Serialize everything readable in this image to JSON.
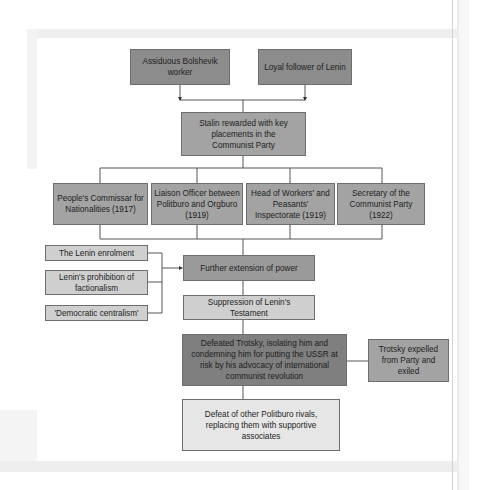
{
  "diagram": {
    "top_causes": [
      {
        "label": "Assiduous Bolshevik worker"
      },
      {
        "label": "Loyal follower of Lenin"
      }
    ],
    "reward": {
      "label": "Stalin rewarded with key placements in the Communist Party"
    },
    "positions": [
      {
        "label": "People's Commissar for Nationalities (1917)"
      },
      {
        "label": "Liaison Officer between Politburo and Orgburo (1919)"
      },
      {
        "label": "Head of Workers' and Peasants' Inspectorate (1919)"
      },
      {
        "label": "Secretary of the Communist Party (1922)"
      }
    ],
    "factors": [
      {
        "label": "The Lenin enrolment"
      },
      {
        "label": "Lenin's prohibition of factionalism"
      },
      {
        "label": "'Democratic centralism'"
      }
    ],
    "extension": {
      "label": "Further extension of power"
    },
    "suppression": {
      "label": "Suppression of Lenin's Testament"
    },
    "defeat_trotsky": {
      "label": "Defeated Trotsky, isolating him and condemning him for putting the USSR at risk by his advocacy of international communist revolution"
    },
    "trotsky_exiled": {
      "label": "Trotsky expelled from Party and exiled"
    },
    "defeat_rivals": {
      "label": "Defeat of other Politburo rivals, replacing them with supportive associates"
    }
  }
}
